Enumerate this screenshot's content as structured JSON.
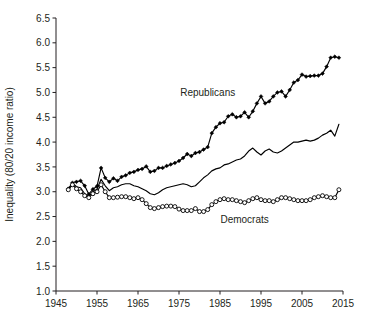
{
  "chart_data": {
    "type": "line",
    "title": "",
    "subtitle": "",
    "xlabel": "",
    "ylabel": "Inequality (80/20 income ratio)",
    "xlim": [
      1945,
      2015
    ],
    "ylim": [
      1.0,
      6.5
    ],
    "xticks": [
      1945,
      1955,
      1965,
      1975,
      1985,
      1995,
      2005,
      2015
    ],
    "xticklabels": [
      "1945",
      "1955",
      "1965",
      "1975",
      "1985",
      "1995",
      "2005",
      "2015"
    ],
    "yticks": [
      1.0,
      1.5,
      2.0,
      2.5,
      3.0,
      3.5,
      4.0,
      4.5,
      5.0,
      5.5,
      6.0,
      6.5
    ],
    "yticklabels": [
      "1.0",
      "1.5",
      "2.0",
      "2.5",
      "3.0",
      "3.5",
      "4.0",
      "4.5",
      "5.0",
      "5.5",
      "6.0",
      "6.5"
    ],
    "grid": false,
    "legend_position": "inline-annotation",
    "annotations": [
      {
        "text": "Republicans",
        "x": 1982,
        "y": 4.92
      },
      {
        "text": "Democrats",
        "x": 1991,
        "y": 2.36
      }
    ],
    "series": [
      {
        "name": "Republicans",
        "marker": "filled-diamond",
        "color": "#000000",
        "x": [
          1948,
          1949,
          1950,
          1951,
          1952,
          1953,
          1954,
          1955,
          1956,
          1957,
          1958,
          1959,
          1960,
          1961,
          1962,
          1963,
          1964,
          1965,
          1966,
          1967,
          1968,
          1969,
          1970,
          1971,
          1972,
          1973,
          1974,
          1975,
          1976,
          1977,
          1978,
          1979,
          1980,
          1981,
          1982,
          1983,
          1984,
          1985,
          1986,
          1987,
          1988,
          1989,
          1990,
          1991,
          1992,
          1993,
          1994,
          1995,
          1996,
          1997,
          1998,
          1999,
          2000,
          2001,
          2002,
          2003,
          2004,
          2005,
          2006,
          2007,
          2008,
          2009,
          2010,
          2011,
          2012,
          2013,
          2014
        ],
        "values": [
          3.06,
          3.18,
          3.2,
          3.22,
          3.12,
          2.95,
          3.05,
          3.11,
          3.48,
          3.28,
          3.2,
          3.27,
          3.22,
          3.3,
          3.33,
          3.38,
          3.4,
          3.44,
          3.46,
          3.51,
          3.4,
          3.42,
          3.48,
          3.48,
          3.52,
          3.55,
          3.58,
          3.62,
          3.68,
          3.76,
          3.72,
          3.78,
          3.8,
          3.85,
          3.9,
          4.18,
          4.3,
          4.38,
          4.4,
          4.52,
          4.56,
          4.5,
          4.52,
          4.6,
          4.5,
          4.62,
          4.78,
          4.92,
          4.78,
          4.82,
          4.92,
          5.0,
          5.02,
          4.92,
          5.05,
          5.2,
          5.25,
          5.36,
          5.32,
          5.33,
          5.34,
          5.34,
          5.38,
          5.52,
          5.7,
          5.72,
          5.7
        ]
      },
      {
        "name": "All",
        "marker": "none",
        "color": "#000000",
        "x": [
          1948,
          1949,
          1950,
          1951,
          1952,
          1953,
          1954,
          1955,
          1956,
          1957,
          1958,
          1959,
          1960,
          1961,
          1962,
          1963,
          1964,
          1965,
          1966,
          1967,
          1968,
          1969,
          1970,
          1971,
          1972,
          1973,
          1974,
          1975,
          1976,
          1977,
          1978,
          1979,
          1980,
          1981,
          1982,
          1983,
          1984,
          1985,
          1986,
          1987,
          1988,
          1989,
          1990,
          1991,
          1992,
          1993,
          1994,
          1995,
          1996,
          1997,
          1998,
          1999,
          2000,
          2001,
          2002,
          2003,
          2004,
          2005,
          2006,
          2007,
          2008,
          2009,
          2010,
          2011,
          2012,
          2013,
          2014
        ],
        "values": [
          3.04,
          3.18,
          3.1,
          3.08,
          2.96,
          2.9,
          3.0,
          3.05,
          3.25,
          3.12,
          3.02,
          3.08,
          3.1,
          3.14,
          3.16,
          3.16,
          3.12,
          3.1,
          3.06,
          3.02,
          2.96,
          2.94,
          2.98,
          3.04,
          3.08,
          3.1,
          3.12,
          3.14,
          3.16,
          3.14,
          3.1,
          3.12,
          3.2,
          3.28,
          3.34,
          3.42,
          3.46,
          3.48,
          3.54,
          3.56,
          3.6,
          3.64,
          3.66,
          3.72,
          3.82,
          3.88,
          3.8,
          3.74,
          3.82,
          3.86,
          3.8,
          3.78,
          3.82,
          3.88,
          3.94,
          4.0,
          4.0,
          4.02,
          4.04,
          4.02,
          4.04,
          4.08,
          4.14,
          4.18,
          4.24,
          4.12,
          4.36
        ]
      },
      {
        "name": "Democrats",
        "marker": "open-circle",
        "color": "#000000",
        "x": [
          1948,
          1949,
          1950,
          1951,
          1952,
          1953,
          1954,
          1955,
          1956,
          1957,
          1958,
          1959,
          1960,
          1961,
          1962,
          1963,
          1964,
          1965,
          1966,
          1967,
          1968,
          1969,
          1970,
          1971,
          1972,
          1973,
          1974,
          1975,
          1976,
          1977,
          1978,
          1979,
          1980,
          1981,
          1982,
          1983,
          1984,
          1985,
          1986,
          1987,
          1988,
          1989,
          1990,
          1991,
          1992,
          1993,
          1994,
          1995,
          1996,
          1997,
          1998,
          1999,
          2000,
          2001,
          2002,
          2003,
          2004,
          2005,
          2006,
          2007,
          2008,
          2009,
          2010,
          2011,
          2012,
          2013,
          2014
        ],
        "values": [
          3.04,
          3.14,
          3.06,
          3.0,
          2.92,
          2.88,
          2.96,
          3.0,
          3.14,
          3.0,
          2.88,
          2.88,
          2.89,
          2.9,
          2.9,
          2.88,
          2.86,
          2.88,
          2.84,
          2.76,
          2.68,
          2.66,
          2.68,
          2.7,
          2.71,
          2.71,
          2.7,
          2.65,
          2.62,
          2.62,
          2.62,
          2.66,
          2.6,
          2.6,
          2.64,
          2.74,
          2.8,
          2.84,
          2.86,
          2.84,
          2.84,
          2.82,
          2.8,
          2.78,
          2.82,
          2.86,
          2.88,
          2.84,
          2.82,
          2.82,
          2.8,
          2.84,
          2.88,
          2.88,
          2.86,
          2.84,
          2.82,
          2.82,
          2.82,
          2.84,
          2.88,
          2.9,
          2.92,
          2.9,
          2.88,
          2.88,
          3.04
        ]
      }
    ]
  },
  "caption": {
    "sliver_text": ""
  }
}
